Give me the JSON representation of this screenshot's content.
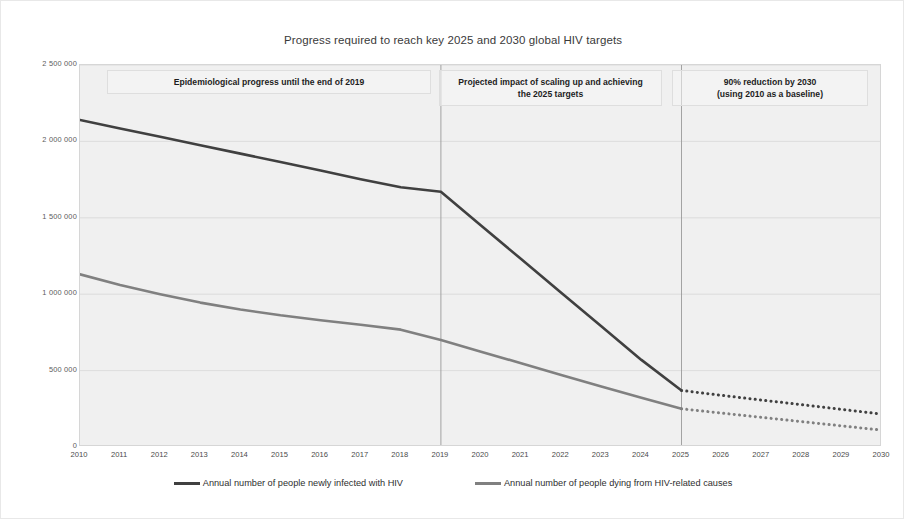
{
  "chart_data": {
    "type": "line",
    "title": "Progress required to reach key 2025 and 2030 global HIV targets",
    "xlabel": "",
    "ylabel": "",
    "grid": true,
    "legend_position": "bottom",
    "xlim": [
      2010,
      2030
    ],
    "ylim": [
      0,
      2500000
    ],
    "x": [
      2010,
      2011,
      2012,
      2013,
      2014,
      2015,
      2016,
      2017,
      2018,
      2019,
      2020,
      2021,
      2022,
      2023,
      2024,
      2025,
      2026,
      2027,
      2028,
      2029,
      2030
    ],
    "categories": [
      "2010",
      "2011",
      "2012",
      "2013",
      "2014",
      "2015",
      "2016",
      "2017",
      "2018",
      "2019",
      "2020",
      "2021",
      "2022",
      "2023",
      "2024",
      "2025",
      "2026",
      "2027",
      "2028",
      "2029",
      "2030"
    ],
    "ytick_labels": [
      "2 500 000",
      "2 000 000",
      "1 500 000",
      "1 000 000",
      "500 000",
      "0"
    ],
    "ytick_values": [
      2500000,
      2000000,
      1500000,
      1000000,
      500000,
      0
    ],
    "series": [
      {
        "name": "Annual number of people newly infected with HIV",
        "color": "#404040",
        "style": "solid-then-dotted",
        "solid_until": 2025,
        "values": [
          2140000,
          2085000,
          2030000,
          1975000,
          1920000,
          1865000,
          1810000,
          1752000,
          1700000,
          1670000,
          1450000,
          1230000,
          1010000,
          790000,
          570000,
          370000,
          338000,
          307000,
          277000,
          246000,
          215000
        ]
      },
      {
        "name": "Annual number of people dying from HIV-related causes",
        "color": "#808080",
        "style": "solid-then-dotted",
        "solid_until": 2025,
        "values": [
          1130000,
          1060000,
          1000000,
          945000,
          900000,
          862000,
          830000,
          800000,
          768000,
          700000,
          624000,
          548000,
          472000,
          396000,
          322000,
          250000,
          222000,
          194000,
          166000,
          138000,
          110000
        ]
      }
    ],
    "panels": [
      {
        "label": "Epidemiological progress until the end of 2019",
        "start": 2010,
        "end": 2019
      },
      {
        "label": "Projected impact of scaling up and achieving\nthe 2025 targets",
        "line1": "Projected impact of scaling up and achieving",
        "line2": "the 2025 targets",
        "start": 2019,
        "end": 2025
      },
      {
        "label": "90% reduction by 2030\n(using 2010 as a baseline)",
        "line1": "90% reduction by 2030",
        "line2": "(using 2010 as a baseline)",
        "start": 2025,
        "end": 2030
      }
    ],
    "panel_dividers": [
      2019,
      2025
    ],
    "colors": {
      "infections_line": "#404040",
      "deaths_line": "#808080",
      "plot_background": "#f0f0f0",
      "gridline": "#d8d8d8",
      "panel_divider": "#9a9a9a"
    }
  },
  "panel_headers": {
    "p0_line1": "Epidemiological progress until the end of 2019",
    "p0_line2": "",
    "p1_line1": "Projected impact of scaling up and achieving",
    "p1_line2": "the 2025 targets",
    "p2_line1": "90% reduction by 2030",
    "p2_line2": "(using 2010 as a baseline)"
  },
  "legend": {
    "items": [
      {
        "label": "Annual number of people newly infected with HIV",
        "color": "#404040"
      },
      {
        "label": "Annual number of people dying from HIV-related causes",
        "color": "#808080"
      }
    ]
  }
}
